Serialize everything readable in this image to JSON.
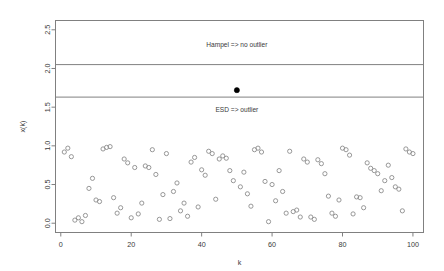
{
  "chart_data": {
    "type": "scatter",
    "title": "",
    "xlabel": "k",
    "ylabel": "x(k)",
    "xlim": [
      -1.5,
      103
    ],
    "ylim": [
      -0.12,
      2.62
    ],
    "xticks": [
      0,
      20,
      40,
      60,
      80,
      100
    ],
    "xticklabels": [
      "0",
      "20",
      "40",
      "60",
      "80",
      "100"
    ],
    "yticks": [
      0.0,
      0.5,
      1.0,
      1.5,
      2.0,
      2.5
    ],
    "yticklabels": [
      "0.0",
      "0.5",
      "1.0",
      "1.5",
      "2.0",
      "2.5"
    ],
    "grid": false,
    "legend": null,
    "series": [
      {
        "name": "data",
        "marker": "open-circle",
        "color": "#8c8c8c",
        "x": [
          1,
          2,
          3,
          4,
          5,
          6,
          7,
          8,
          9,
          10,
          11,
          12,
          13,
          14,
          15,
          16,
          17,
          18,
          19,
          20,
          21,
          22,
          23,
          24,
          25,
          26,
          27,
          28,
          29,
          30,
          31,
          32,
          33,
          34,
          35,
          36,
          37,
          38,
          39,
          40,
          41,
          42,
          43,
          44,
          45,
          46,
          47,
          48,
          49,
          51,
          52,
          53,
          54,
          55,
          56,
          57,
          58,
          59,
          60,
          61,
          62,
          63,
          64,
          65,
          66,
          67,
          68,
          69,
          70,
          71,
          72,
          73,
          74,
          75,
          76,
          77,
          78,
          79,
          80,
          81,
          82,
          83,
          84,
          85,
          86,
          87,
          88,
          89,
          90,
          91,
          92,
          93,
          94,
          95,
          96,
          97,
          98,
          99,
          100
        ],
        "y": [
          0.92,
          0.97,
          0.86,
          0.04,
          0.07,
          0.02,
          0.1,
          0.45,
          0.58,
          0.3,
          0.28,
          0.96,
          0.98,
          0.99,
          0.33,
          0.13,
          0.2,
          0.83,
          0.78,
          0.07,
          0.72,
          0.12,
          0.26,
          0.74,
          0.72,
          0.95,
          0.63,
          0.05,
          0.37,
          0.9,
          0.06,
          0.41,
          0.52,
          0.16,
          0.26,
          0.09,
          0.79,
          0.85,
          0.21,
          0.69,
          0.62,
          0.93,
          0.9,
          0.31,
          0.83,
          0.87,
          0.84,
          0.68,
          0.55,
          0.47,
          0.66,
          0.38,
          0.22,
          0.95,
          0.97,
          0.92,
          0.54,
          0.02,
          0.5,
          0.29,
          0.68,
          0.41,
          0.13,
          0.93,
          0.15,
          0.17,
          0.08,
          0.83,
          0.79,
          0.08,
          0.05,
          0.82,
          0.77,
          0.64,
          0.35,
          0.13,
          0.09,
          0.3,
          0.97,
          0.95,
          0.88,
          0.12,
          0.34,
          0.33,
          0.2,
          0.78,
          0.71,
          0.68,
          0.64,
          0.42,
          0.55,
          0.75,
          0.59,
          0.47,
          0.44,
          0.16,
          0.96,
          0.92,
          0.9
        ]
      },
      {
        "name": "outlier",
        "marker": "solid-circle",
        "color": "#000000",
        "x": [
          50
        ],
        "y": [
          1.72
        ]
      }
    ],
    "hlines": [
      {
        "name": "hampel-threshold",
        "y": 2.05,
        "color": "#808080"
      },
      {
        "name": "esd-threshold",
        "y": 1.63,
        "color": "#808080"
      }
    ],
    "annotations": [
      {
        "name": "hampel-annotation",
        "text": "Hampel => no outlier",
        "x": 50,
        "y": 2.28
      },
      {
        "name": "esd-annotation",
        "text": "ESD => outlier",
        "x": 50,
        "y": 1.44
      }
    ]
  }
}
